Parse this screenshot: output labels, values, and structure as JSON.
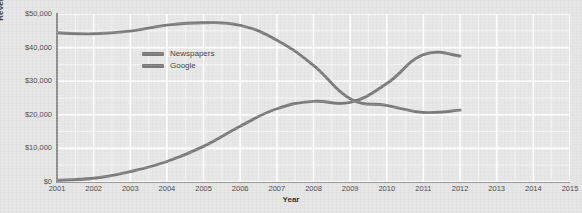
{
  "chart_data": {
    "type": "line",
    "title": "",
    "xlabel": "Year",
    "ylabel": "Revenues in millions",
    "x": [
      2001,
      2002,
      2003,
      2004,
      2005,
      2006,
      2007,
      2008,
      2009,
      2010,
      2011,
      2012,
      2013,
      2014,
      2015
    ],
    "xtick_labels": [
      "2001",
      "2002",
      "2003",
      "2004",
      "2005",
      "2006",
      "2007",
      "2008",
      "2009",
      "2010",
      "2011",
      "2012",
      "2013",
      "2014",
      "2015"
    ],
    "ytick_labels": [
      "$0",
      "$10,000",
      "$20,000",
      "$30,000",
      "$40,000",
      "$50,000"
    ],
    "ytick_values": [
      0,
      10000,
      20000,
      30000,
      40000,
      50000
    ],
    "ylim": [
      0,
      50000
    ],
    "xlim": [
      2001,
      2015
    ],
    "grid": true,
    "minor_grid": true,
    "legend_position": "upper-left-inside",
    "series": [
      {
        "name": "Newspapers",
        "color": "#7a7a7a",
        "x": [
          2001,
          2002,
          2003,
          2004,
          2005,
          2006,
          2007,
          2008,
          2009,
          2010,
          2011,
          2012
        ],
        "values": [
          44400,
          44100,
          44900,
          46700,
          47400,
          46600,
          42200,
          34700,
          24800,
          22800,
          20700,
          21400
        ]
      },
      {
        "name": "Google",
        "color": "#7a7a7a",
        "x": [
          2001,
          2002,
          2003,
          2004,
          2005,
          2006,
          2007,
          2008,
          2009,
          2010,
          2011,
          2012
        ],
        "values": [
          500,
          1100,
          3100,
          6100,
          10600,
          16600,
          21800,
          24000,
          23700,
          29300,
          37900,
          37500
        ]
      }
    ]
  },
  "axis": {
    "y_title": "Revenues in millions",
    "x_title": "Year"
  },
  "legend": {
    "items": [
      {
        "label": "Newspapers",
        "color": "#7a7a7a"
      },
      {
        "label": "Google",
        "color": "#7a7a7a"
      }
    ]
  },
  "colors": {
    "background": "#e4e4e4",
    "plot_background": "#e6e6e6",
    "gridline": "#ffffff",
    "axis": "#8d8d8d",
    "line": "#7a7a7a",
    "text": "#4a4a4a"
  }
}
